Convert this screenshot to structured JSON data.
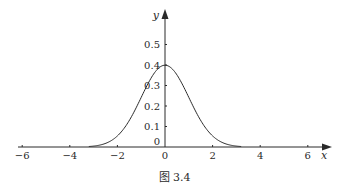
{
  "chart_data": {
    "type": "line",
    "title": "",
    "caption": "图 3.4",
    "xlabel": "x",
    "ylabel": "y",
    "xlim": [
      -6.5,
      7
    ],
    "ylim": [
      0,
      0.58
    ],
    "x_ticks": [
      -6,
      -4,
      -2,
      0,
      2,
      4,
      6
    ],
    "x_tick_labels": [
      "−6",
      "−4",
      "−2",
      "0",
      "2",
      "4",
      "6"
    ],
    "y_ticks": [
      0,
      0.1,
      0.2,
      0.3,
      0.4,
      0.5
    ],
    "y_tick_labels": [
      "0",
      "0.1",
      "0.2",
      "0.3",
      "0.4",
      "0.5"
    ],
    "grid": false,
    "legend": null,
    "series": [
      {
        "name": "standard normal density",
        "x": [
          -3.2,
          -3,
          -2.5,
          -2,
          -1.5,
          -1,
          -0.5,
          0,
          0.5,
          1,
          1.5,
          2,
          2.5,
          3,
          3.2
        ],
        "values": [
          0.002,
          0.004,
          0.018,
          0.054,
          0.13,
          0.242,
          0.352,
          0.399,
          0.352,
          0.242,
          0.13,
          0.054,
          0.018,
          0.004,
          0.002
        ]
      }
    ],
    "colors": {
      "line": "#2a2a2a",
      "axis": "#2a2a2a"
    }
  }
}
